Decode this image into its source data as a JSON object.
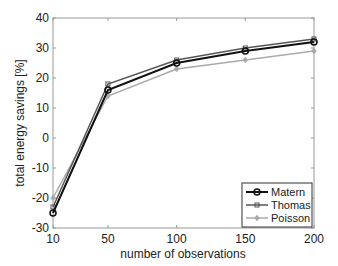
{
  "chart_data": {
    "type": "line",
    "title": "",
    "xlabel": "number of observations",
    "ylabel": "total energy savings [%]",
    "x": [
      10,
      50,
      100,
      150,
      200
    ],
    "xticks": [
      10,
      50,
      100,
      150,
      200
    ],
    "yticks": [
      -30,
      -20,
      -10,
      0,
      10,
      20,
      30,
      40
    ],
    "xlim": [
      10,
      200
    ],
    "ylim": [
      -30,
      40
    ],
    "grid": false,
    "legend_position": "lower right",
    "series": [
      {
        "name": "Matern",
        "values": [
          -25,
          16,
          25,
          29,
          32
        ],
        "color": "#111111",
        "marker": "circle",
        "width": 2
      },
      {
        "name": "Thomas",
        "values": [
          -23,
          18,
          26,
          30,
          33
        ],
        "color": "#555555",
        "marker": "square",
        "width": 1.5
      },
      {
        "name": "Poisson",
        "values": [
          -20,
          14,
          23,
          26,
          29
        ],
        "color": "#aaaaaa",
        "marker": "diamond",
        "width": 1.5
      }
    ]
  }
}
